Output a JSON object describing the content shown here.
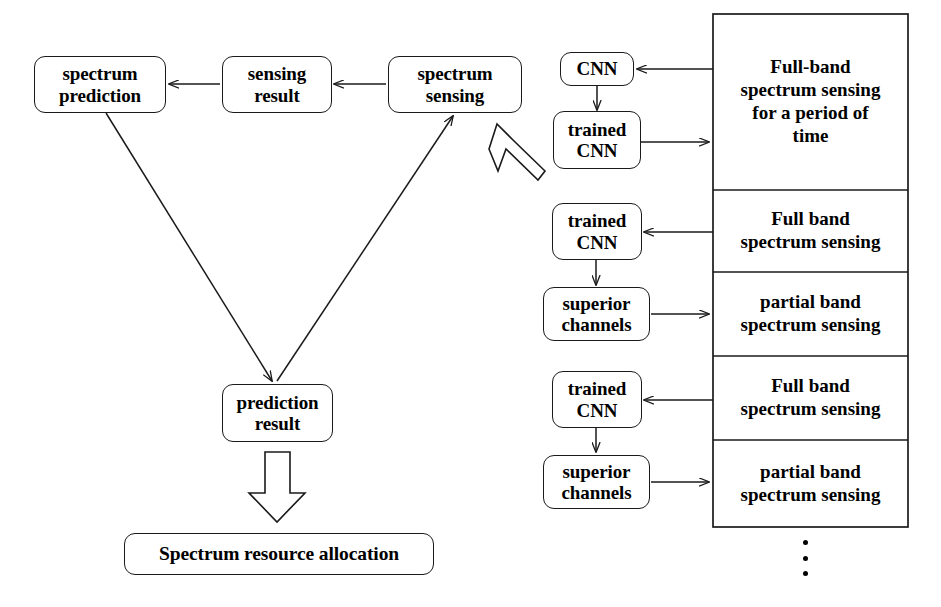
{
  "figure": {
    "type": "flow-diagram",
    "width": 941,
    "height": 607,
    "line_color": "#1a1a1a",
    "text_color": "#000000",
    "background": "#ffffff"
  },
  "left_flow": {
    "nodes": [
      {
        "id": "spectrum-prediction",
        "label": "spectrum\nprediction"
      },
      {
        "id": "sensing-result",
        "label": "sensing\nresult"
      },
      {
        "id": "spectrum-sensing",
        "label": "spectrum\nsensing"
      },
      {
        "id": "prediction-result",
        "label": "prediction\nresult"
      },
      {
        "id": "spectrum-resource-allocation",
        "label": "Spectrum resource allocation"
      }
    ],
    "edges": [
      {
        "from": "spectrum-sensing",
        "to": "sensing-result",
        "style": "thin-arrow"
      },
      {
        "from": "sensing-result",
        "to": "spectrum-prediction",
        "style": "thin-arrow"
      },
      {
        "from": "spectrum-prediction",
        "to": "prediction-result",
        "style": "thin-arrow"
      },
      {
        "from": "prediction-result",
        "to": "spectrum-sensing",
        "style": "thin-arrow"
      },
      {
        "from": "prediction-result",
        "to": "spectrum-resource-allocation",
        "style": "block-arrow"
      }
    ]
  },
  "right_panel": {
    "block_arrow_to_spectrum_sensing": "hollow block arrow pointing up-left",
    "sections": [
      {
        "id": "section-1",
        "label": "Full-band\nspectrum sensing\nfor a period of\ntime"
      },
      {
        "id": "section-2",
        "label": "Full band\nspectrum sensing"
      },
      {
        "id": "section-3",
        "label": "partial band\nspectrum sensing"
      },
      {
        "id": "section-4",
        "label": "Full band\nspectrum sensing"
      },
      {
        "id": "section-5",
        "label": "partial band\nspectrum sensing"
      }
    ],
    "side_nodes": [
      {
        "id": "cnn-1",
        "label": "CNN"
      },
      {
        "id": "trained-cnn-1",
        "label": "trained\nCNN"
      },
      {
        "id": "trained-cnn-2",
        "label": "trained\nCNN"
      },
      {
        "id": "superior-channels-1",
        "label": "superior\nchannels"
      },
      {
        "id": "trained-cnn-3",
        "label": "trained\nCNN"
      },
      {
        "id": "superior-channels-2",
        "label": "superior\nchannels"
      }
    ],
    "continuation": "⋮"
  }
}
